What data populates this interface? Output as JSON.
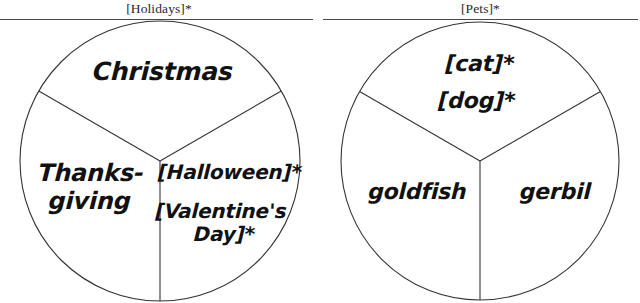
{
  "canvas": {
    "width": 640,
    "height": 303,
    "background": "#ffffff"
  },
  "style": {
    "line_color": "#333333",
    "rule_color": "#4a4a4a",
    "text_color": "#111111",
    "title_color": "#2a2a2a"
  },
  "panels": [
    {
      "id": "holidays",
      "title": "[Holidays]*",
      "circle": {
        "cx": 160,
        "cy": 161,
        "r": 140
      },
      "sectors": [
        {
          "id": "christmas",
          "position": "top",
          "start_angle_deg": -150,
          "end_angle_deg": -30,
          "labels": [
            "Christmas"
          ]
        },
        {
          "id": "thanksgiving",
          "position": "lower-left",
          "start_angle_deg": 90,
          "end_angle_deg": 210,
          "labels": [
            "Thanks-",
            "giving"
          ]
        },
        {
          "id": "halloween-valentines",
          "position": "lower-right",
          "start_angle_deg": -30,
          "end_angle_deg": 90,
          "labels": [
            "[Halloween]*",
            "[Valentine's",
            "Day]*"
          ]
        }
      ]
    },
    {
      "id": "pets",
      "title": "[Pets]*",
      "circle": {
        "cx": 480,
        "cy": 161,
        "r": 139
      },
      "sectors": [
        {
          "id": "cat-dog",
          "position": "top",
          "start_angle_deg": -150,
          "end_angle_deg": -30,
          "labels": [
            "[cat]*",
            "[dog]*"
          ]
        },
        {
          "id": "goldfish",
          "position": "lower-left",
          "start_angle_deg": 90,
          "end_angle_deg": 210,
          "labels": [
            "goldfish"
          ]
        },
        {
          "id": "gerbil",
          "position": "lower-right",
          "start_angle_deg": -30,
          "end_angle_deg": 90,
          "labels": [
            "gerbil"
          ]
        }
      ]
    }
  ],
  "labels": {
    "holidays_title": "[Holidays]*",
    "pets_title": "[Pets]*",
    "christmas": "Christmas",
    "thanks_line1": "Thanks-",
    "thanks_line2": "giving",
    "halloween": "[Halloween]*",
    "valentines_line1": "[Valentine's",
    "valentines_line2": "Day]*",
    "cat": "[cat]*",
    "dog": "[dog]*",
    "goldfish": "goldfish",
    "gerbil": "gerbil"
  }
}
